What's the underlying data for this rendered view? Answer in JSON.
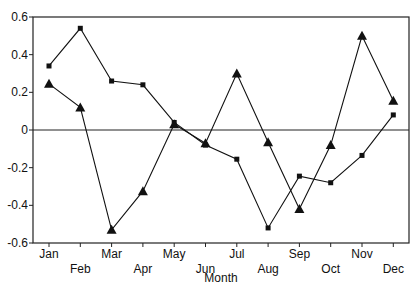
{
  "chart_data": {
    "type": "line",
    "title": "",
    "xlabel": "Month",
    "ylabel": "",
    "categories": [
      "Jan",
      "Feb",
      "Mar",
      "Apr",
      "May",
      "Jun",
      "Jul",
      "Aug",
      "Sep",
      "Oct",
      "Nov",
      "Dec"
    ],
    "series": [
      {
        "name": "Series 1 (square markers)",
        "marker": "square",
        "values": [
          0.34,
          0.54,
          0.26,
          0.24,
          0.04,
          -0.08,
          -0.155,
          -0.52,
          -0.245,
          -0.28,
          -0.135,
          0.08
        ]
      },
      {
        "name": "Series 2 (triangle markers)",
        "marker": "triangle",
        "values": [
          0.245,
          0.12,
          -0.53,
          -0.325,
          0.03,
          -0.07,
          0.3,
          -0.065,
          -0.42,
          -0.08,
          0.5,
          0.155
        ]
      }
    ],
    "ylim": [
      -0.6,
      0.6
    ],
    "yticks": [
      0.6,
      0.4,
      0.2,
      0,
      -0.2,
      -0.4,
      -0.6
    ],
    "ytick_labels": [
      "0.6",
      "0.4",
      "0.2",
      "0",
      "-0.2",
      "-0.4",
      "-0.6"
    ],
    "reference_line": 0,
    "grid": false,
    "legend": "none",
    "colors": {
      "line": "#111111",
      "axis": "#222222",
      "background": "#ffffff"
    }
  }
}
